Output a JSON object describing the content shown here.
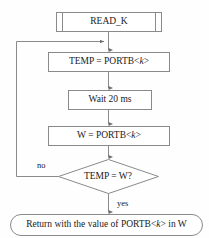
{
  "diagram": {
    "type": "flowchart",
    "line_color": "#808080",
    "text_color": "#1a1a1a",
    "background": "#fefefe",
    "nodes": [
      {
        "id": "read_k",
        "shape": "predefined-process",
        "label": "READ_K",
        "label_prefix": "READ_K",
        "label_italic": "",
        "label_suffix": ""
      },
      {
        "id": "temp_assign",
        "shape": "process",
        "label": "TEMP = PORTB<k>",
        "label_prefix": "TEMP = PORTB<",
        "label_italic": "k",
        "label_suffix": ">"
      },
      {
        "id": "wait",
        "shape": "process",
        "label": "Wait 20 ms",
        "label_prefix": "Wait 20 ms",
        "label_italic": "",
        "label_suffix": ""
      },
      {
        "id": "w_assign",
        "shape": "process",
        "label": "W = PORTB<k>",
        "label_prefix": "W = PORTB<",
        "label_italic": "k",
        "label_suffix": ">"
      },
      {
        "id": "compare",
        "shape": "decision",
        "label": "TEMP = W?",
        "label_prefix": "TEMP = W?",
        "label_italic": "",
        "label_suffix": ""
      },
      {
        "id": "return",
        "shape": "terminator-rounded",
        "label": "Return with the value of PORTB<k> in W",
        "label_prefix": "Return with the value of PORTB<",
        "label_italic": "k",
        "label_suffix": "> in W"
      }
    ],
    "edges": [
      {
        "id": "e1",
        "from": "read_k",
        "to": "temp_assign",
        "label": ""
      },
      {
        "id": "e2",
        "from": "temp_assign",
        "to": "wait",
        "label": ""
      },
      {
        "id": "e3",
        "from": "wait",
        "to": "w_assign",
        "label": ""
      },
      {
        "id": "e4",
        "from": "w_assign",
        "to": "compare",
        "label": ""
      },
      {
        "id": "e5",
        "from": "compare",
        "to": "return",
        "label": "yes"
      },
      {
        "id": "e6",
        "from": "compare",
        "to": "temp_assign",
        "label": "no"
      }
    ],
    "edge_labels": {
      "no": "no",
      "yes": "yes"
    }
  }
}
